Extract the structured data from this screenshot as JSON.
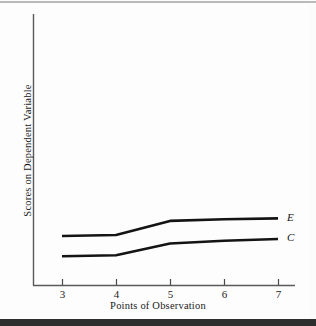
{
  "figure": {
    "background_color": "#fdfdfd",
    "ink_color": "#1a1a1a"
  },
  "chart_data": {
    "type": "line",
    "title": "",
    "subtitle": "",
    "xlabel": "Points of Observation",
    "ylabel": "Scores on Dependent Variable",
    "x": [
      3,
      4,
      5,
      6,
      7
    ],
    "xticklabels": [
      "3",
      "4",
      "5",
      "6",
      "7"
    ],
    "yticklabels": [],
    "xlim": [
      2.5,
      7.4
    ],
    "ylim": [
      0,
      10
    ],
    "grid": false,
    "legend": "inline-endpoint-labels",
    "annotations": [
      "E",
      "C"
    ],
    "series": [
      {
        "name": "E",
        "label": "E",
        "color": "#141414",
        "values": [
          2.45,
          2.5,
          3.2,
          3.28,
          3.32
        ]
      },
      {
        "name": "C",
        "label": "C",
        "color": "#141414",
        "values": [
          1.45,
          1.5,
          2.08,
          2.22,
          2.3
        ]
      }
    ]
  },
  "axes": {
    "x_ticks": [
      {
        "label": "3"
      },
      {
        "label": "4"
      },
      {
        "label": "5"
      },
      {
        "label": "6"
      },
      {
        "label": "7"
      }
    ],
    "x_title": "Points of Observation",
    "y_title": "Scores on Dependent Variable"
  },
  "series_labels": {
    "e": "E",
    "c": "C"
  }
}
